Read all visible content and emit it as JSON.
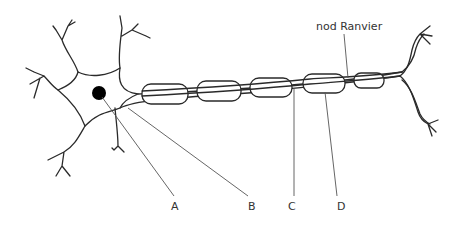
{
  "diagram": {
    "labels": {
      "A": "A",
      "B": "B",
      "C": "C",
      "D": "D",
      "node": "nod Ranvier"
    },
    "colors": {
      "stroke": "#2a2a2a",
      "nucleus": "#000000",
      "background": "#ffffff"
    }
  }
}
